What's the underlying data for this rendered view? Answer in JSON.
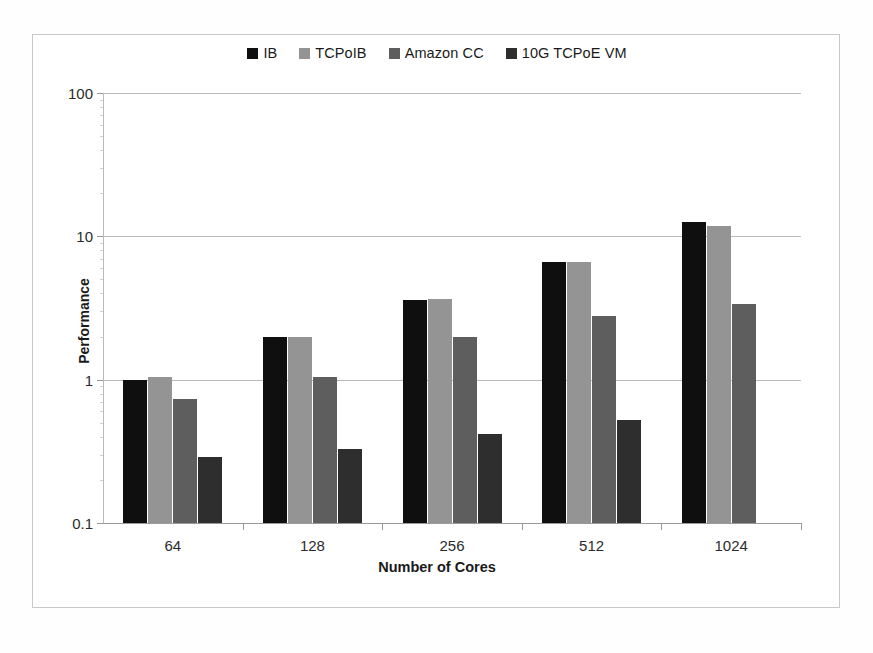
{
  "chart_data": {
    "type": "bar",
    "title": "",
    "xlabel": "Number of Cores",
    "ylabel": "Performance",
    "categories": [
      "64",
      "128",
      "256",
      "512",
      "1024"
    ],
    "yscale": "log",
    "ylim": [
      0.1,
      100
    ],
    "ytick_labels": [
      "100",
      "10",
      "1",
      "0.1"
    ],
    "ytick_values": [
      100,
      10,
      1,
      0.1
    ],
    "grid": true,
    "legend_position": "top-center",
    "series": [
      {
        "name": "IB",
        "color": "#0f0f0f",
        "values": [
          1.0,
          2.0,
          3.6,
          6.6,
          12.5
        ]
      },
      {
        "name": "TCPoIB",
        "color": "#949494",
        "values": [
          1.05,
          2.0,
          3.65,
          6.6,
          11.8
        ]
      },
      {
        "name": "Amazon CC",
        "color": "#5e5e5e",
        "values": [
          0.73,
          1.05,
          2.0,
          2.8,
          3.4
        ]
      },
      {
        "name": "10G TCPoE VM",
        "color": "#2e2e2e",
        "values": [
          0.29,
          0.33,
          0.42,
          0.52,
          null
        ]
      }
    ]
  }
}
